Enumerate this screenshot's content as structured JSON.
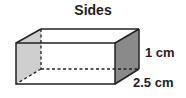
{
  "title": "Sides",
  "labels": {
    "height": "1 cm",
    "depth": "2.5 cm"
  },
  "colors": {
    "left_face": "#cfcfcf",
    "right_face": "#8a8a8a",
    "edge": "#222222"
  }
}
